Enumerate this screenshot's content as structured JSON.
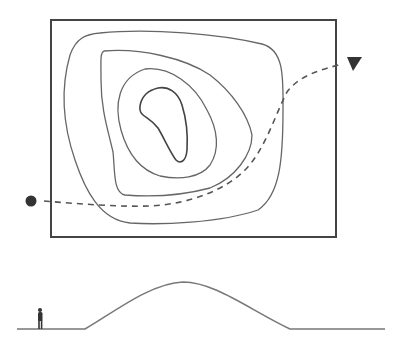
{
  "diagram": {
    "colors": {
      "frame": "#444444",
      "contour": "#666666",
      "inner_contour": "#444444",
      "path": "#555555",
      "ground": "#777777",
      "figure": "#333333"
    },
    "map": {
      "frame": {
        "x": 51,
        "y": 20,
        "width": 285,
        "height": 217
      },
      "contour_count": 4,
      "start_marker": "circle-dot",
      "end_marker": "triangle-arrow"
    },
    "profile": {
      "ground_y": 329,
      "hill_peak": {
        "x": 183,
        "y": 282
      },
      "scale_figure": "person"
    }
  }
}
